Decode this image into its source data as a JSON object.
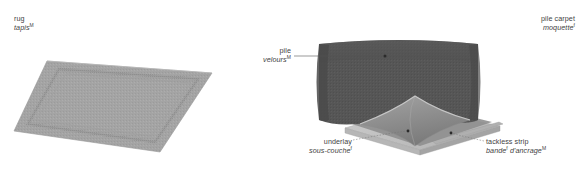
{
  "page": {
    "background": "#ffffff",
    "text_color": "#3f3f3f",
    "width": 581,
    "height": 170
  },
  "palette": {
    "rug_face": "#a6a6a6",
    "rug_border": "#9a9a9a",
    "carpet_pile_top": "#565656",
    "carpet_pile_side": "#4e4e4e",
    "carpet_backing": "#8a8a8a",
    "carpet_fold_light": "#9d9d9d",
    "underlay_top": "#c2c2c2",
    "underlay_edge": "#a8a8a8",
    "tackless_strip": "#b0b0b0",
    "leader_line": "#555555",
    "leader_dot": "#2b2b2b"
  },
  "labels": {
    "rug": {
      "en": "rug",
      "fr": "tapis",
      "fr_marker": "M"
    },
    "pile_carpet": {
      "en": "pile carpet",
      "fr": "moquette",
      "fr_marker": "f"
    },
    "pile": {
      "en": "pile",
      "fr": "velours",
      "fr_marker": "M"
    },
    "underlay": {
      "en": "underlay",
      "fr": "sous-couche",
      "fr_marker": "f"
    },
    "tackless_strip": {
      "en": "tackless strip",
      "fr_part1": "bande",
      "fr_marker1": "f",
      "fr_part2": " d'ancrage",
      "fr_marker2": "M"
    }
  },
  "figures": {
    "left": {
      "name": "rug-illustration",
      "description": "flat rectangular rug shown in perspective with inset decorative border"
    },
    "right": {
      "name": "pile-carpet-illustration",
      "description": "wall-to-wall pile carpet with peeled-back corner revealing underlay and tackless strip"
    }
  }
}
